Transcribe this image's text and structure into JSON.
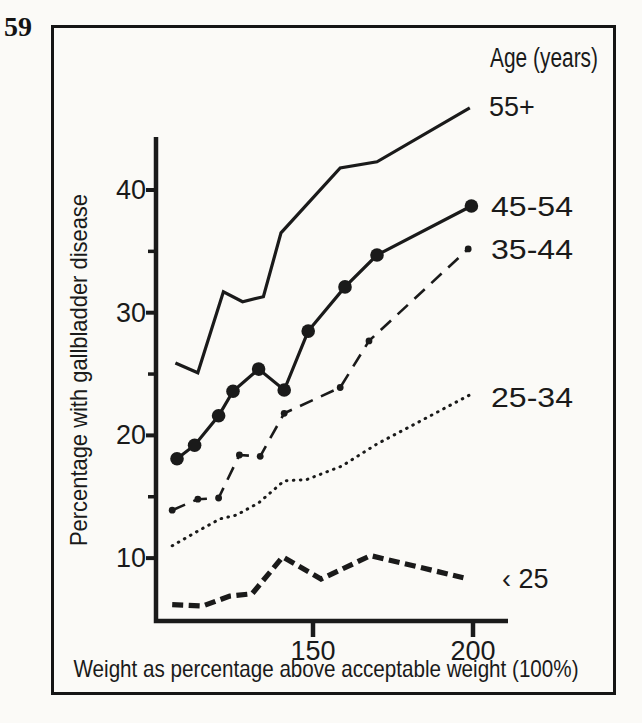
{
  "page": {
    "number": "59",
    "ink": "#1a1a1a",
    "paper": "#fbfaf7"
  },
  "chart_data": {
    "type": "line",
    "title": "",
    "legend_title": "Age (years)",
    "xlabel": "Weight as percentage above acceptable weight (100%)",
    "ylabel": "Percentage with gallbladder disease",
    "x_ticks": [
      150,
      200
    ],
    "x_tick_labels": [
      "150",
      "200"
    ],
    "y_ticks": [
      40,
      30,
      20,
      10
    ],
    "y_tick_labels": [
      "40",
      "30",
      "20",
      "10"
    ],
    "y_minor_ticks": [
      35,
      25,
      15
    ],
    "xlim": [
      101,
      211
    ],
    "ylim": [
      4.5,
      44.3
    ],
    "grid": false,
    "legend_position": "right of line ends",
    "series": [
      {
        "id": "55plus",
        "name": "55+",
        "style": "solid",
        "marker": "none",
        "x": [
          107,
          114,
          122,
          128,
          134.5,
          140,
          158.5,
          170,
          199
        ],
        "y": [
          25.9,
          25.1,
          31.7,
          30.9,
          31.3,
          36.5,
          41.8,
          42.3,
          46.7
        ]
      },
      {
        "id": "45-54",
        "name": "45-54",
        "style": "solid",
        "marker": "filled-circle-large",
        "x": [
          107.5,
          113,
          120.5,
          125,
          133,
          141,
          148.5,
          160,
          170,
          199.5
        ],
        "y": [
          18.1,
          19.2,
          21.6,
          23.6,
          25.4,
          23.7,
          28.5,
          32.1,
          34.7,
          38.7
        ]
      },
      {
        "id": "35-44",
        "name": "35-44",
        "style": "dash-dot",
        "marker": "filled-circle-small",
        "x": [
          106,
          114,
          120.5,
          127,
          133.5,
          141,
          158.5,
          167.5,
          198.5
        ],
        "y": [
          13.9,
          14.8,
          14.9,
          18.4,
          18.3,
          21.8,
          23.9,
          27.7,
          35.2
        ]
      },
      {
        "id": "25-34",
        "name": "25-34",
        "style": "dotted",
        "marker": "none",
        "x": [
          106,
          114,
          121,
          126,
          133,
          141,
          148,
          159,
          170,
          199
        ],
        "y": [
          11.0,
          12.2,
          13.2,
          13.5,
          14.5,
          16.3,
          16.4,
          17.5,
          19.3,
          23.3
        ]
      },
      {
        "id": "under-25",
        "name": "‹ 25",
        "style": "dashed-heavy",
        "marker": "none",
        "x": [
          106,
          115.5,
          124,
          131,
          140.5,
          152.5,
          168,
          197
        ],
        "y": [
          6.2,
          6.1,
          6.9,
          7.1,
          10.1,
          8.3,
          10.2,
          8.4
        ]
      }
    ]
  }
}
